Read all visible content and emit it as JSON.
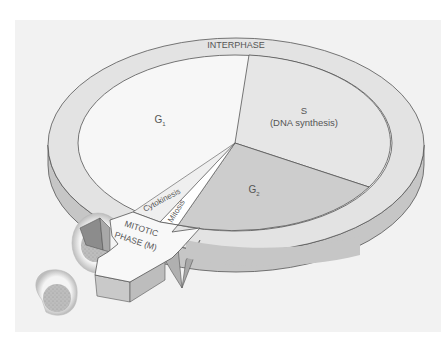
{
  "figure": {
    "ring_label": "INTERPHASE",
    "phases": {
      "g1": {
        "label": "G",
        "subscript": "1",
        "color": "#f7f7f7"
      },
      "s": {
        "label": "S",
        "sublabel": "(DNA synthesis)",
        "color": "#e6e6e6"
      },
      "g2": {
        "label": "G",
        "subscript": "2",
        "color": "#cdcdcd"
      },
      "mitosis": {
        "label": "Mitosis",
        "color": "#ffffff"
      },
      "cytokinesis": {
        "label": "Cytokinesis",
        "color": "#f0f0f0"
      }
    },
    "arrow": {
      "line1": "MITOTIC",
      "line2": "PHASE (M)"
    },
    "colors": {
      "background": "#f2f2f2",
      "ring_top": "#e3e3e3",
      "ring_side": "#c4c4c4",
      "outline": "#555555",
      "text": "#555555"
    }
  }
}
